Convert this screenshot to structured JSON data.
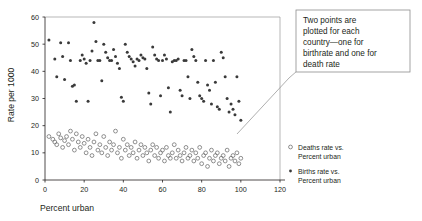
{
  "chart_data": {
    "type": "scatter",
    "title": "",
    "xlabel": "Percent urban",
    "ylabel": "Rate per 1000",
    "xlim": [
      0,
      120
    ],
    "ylim": [
      0,
      60
    ],
    "xticks": [
      0,
      20,
      40,
      60,
      80,
      100,
      120
    ],
    "yticks": [
      0,
      10,
      20,
      30,
      40,
      50,
      60
    ],
    "grid": false,
    "legend_position": "right",
    "annotation": "Two points are plotted for each country—one for birthrate and one for death rate",
    "series": [
      {
        "name": "Births rate vs. Percent urban",
        "marker": "filled-circle",
        "color": "#3a3a3a",
        "points": [
          [
            2,
            51.5
          ],
          [
            5,
            44.5
          ],
          [
            6,
            38
          ],
          [
            8,
            50.5
          ],
          [
            9,
            45.5
          ],
          [
            10,
            37
          ],
          [
            12,
            50.5
          ],
          [
            13,
            44
          ],
          [
            14,
            34.5
          ],
          [
            15,
            35
          ],
          [
            16,
            29
          ],
          [
            18,
            44
          ],
          [
            19,
            46
          ],
          [
            20,
            44.5
          ],
          [
            21,
            43
          ],
          [
            22,
            29
          ],
          [
            23,
            44
          ],
          [
            24,
            47.5
          ],
          [
            25,
            58
          ],
          [
            26,
            51
          ],
          [
            27,
            44
          ],
          [
            28,
            44
          ],
          [
            29,
            36.5
          ],
          [
            30,
            50
          ],
          [
            31,
            47
          ],
          [
            32,
            45
          ],
          [
            33,
            44
          ],
          [
            34,
            44
          ],
          [
            35,
            48
          ],
          [
            36,
            45.5
          ],
          [
            37,
            43
          ],
          [
            38,
            41
          ],
          [
            39,
            30.5
          ],
          [
            40,
            29
          ],
          [
            41,
            50
          ],
          [
            42,
            47
          ],
          [
            43,
            45.5
          ],
          [
            44,
            44.5
          ],
          [
            45,
            43.5
          ],
          [
            46,
            42
          ],
          [
            47,
            44.5
          ],
          [
            48,
            44
          ],
          [
            49,
            46
          ],
          [
            50,
            45
          ],
          [
            51,
            44.5
          ],
          [
            52,
            41
          ],
          [
            53,
            32
          ],
          [
            54,
            28
          ],
          [
            55,
            49
          ],
          [
            56,
            46
          ],
          [
            57,
            44.5
          ],
          [
            58,
            44
          ],
          [
            59,
            31
          ],
          [
            60,
            44
          ],
          [
            61,
            46
          ],
          [
            62,
            44.5
          ],
          [
            63,
            34
          ],
          [
            64,
            25
          ],
          [
            65,
            43.5
          ],
          [
            66,
            44
          ],
          [
            67,
            44
          ],
          [
            68,
            44.5
          ],
          [
            69,
            33
          ],
          [
            70,
            31
          ],
          [
            71,
            44
          ],
          [
            72,
            44
          ],
          [
            73,
            38
          ],
          [
            74,
            30
          ],
          [
            75,
            48
          ],
          [
            76,
            45.5
          ],
          [
            77,
            44
          ],
          [
            78,
            36
          ],
          [
            79,
            31
          ],
          [
            80,
            30
          ],
          [
            81,
            29
          ],
          [
            82,
            44
          ],
          [
            83,
            35
          ],
          [
            84,
            33
          ],
          [
            85,
            28
          ],
          [
            86,
            44
          ],
          [
            87,
            36
          ],
          [
            88,
            27
          ],
          [
            89,
            26
          ],
          [
            90,
            47
          ],
          [
            91,
            45
          ],
          [
            92,
            38
          ],
          [
            93,
            30
          ],
          [
            94,
            25
          ],
          [
            95,
            28
          ],
          [
            96,
            26
          ],
          [
            97,
            24
          ],
          [
            98,
            38
          ],
          [
            99,
            29
          ],
          [
            100,
            22
          ]
        ]
      },
      {
        "name": "Deaths rate vs. Percent urban",
        "marker": "open-circle",
        "color": "#6b6b6b",
        "points": [
          [
            2,
            16
          ],
          [
            4,
            15
          ],
          [
            5,
            14
          ],
          [
            6,
            13
          ],
          [
            7,
            17
          ],
          [
            8,
            15.5
          ],
          [
            9,
            12
          ],
          [
            10,
            14.5
          ],
          [
            11,
            16
          ],
          [
            12,
            13
          ],
          [
            13,
            18
          ],
          [
            14,
            15
          ],
          [
            15,
            11
          ],
          [
            16,
            17
          ],
          [
            17,
            14
          ],
          [
            18,
            12
          ],
          [
            19,
            16
          ],
          [
            20,
            13.5
          ],
          [
            21,
            10
          ],
          [
            22,
            15
          ],
          [
            23,
            12
          ],
          [
            24,
            9
          ],
          [
            25,
            14
          ],
          [
            26,
            17
          ],
          [
            27,
            11
          ],
          [
            28,
            13
          ],
          [
            29,
            10
          ],
          [
            30,
            16
          ],
          [
            31,
            12
          ],
          [
            32,
            9
          ],
          [
            33,
            14
          ],
          [
            34,
            11
          ],
          [
            35,
            13
          ],
          [
            36,
            18
          ],
          [
            37,
            10
          ],
          [
            38,
            12
          ],
          [
            39,
            8
          ],
          [
            40,
            15
          ],
          [
            41,
            11
          ],
          [
            42,
            13
          ],
          [
            43,
            9
          ],
          [
            44,
            12
          ],
          [
            45,
            10
          ],
          [
            46,
            14
          ],
          [
            47,
            8
          ],
          [
            48,
            11
          ],
          [
            49,
            13
          ],
          [
            50,
            9
          ],
          [
            51,
            12
          ],
          [
            52,
            10
          ],
          [
            53,
            7
          ],
          [
            54,
            11
          ],
          [
            55,
            13
          ],
          [
            56,
            9
          ],
          [
            57,
            12
          ],
          [
            58,
            8
          ],
          [
            59,
            10
          ],
          [
            60,
            11
          ],
          [
            61,
            7
          ],
          [
            62,
            12
          ],
          [
            63,
            9
          ],
          [
            64,
            8
          ],
          [
            65,
            10
          ],
          [
            66,
            13
          ],
          [
            67,
            8
          ],
          [
            68,
            11
          ],
          [
            69,
            9
          ],
          [
            70,
            7
          ],
          [
            71,
            10
          ],
          [
            72,
            12
          ],
          [
            73,
            8
          ],
          [
            74,
            9
          ],
          [
            75,
            11
          ],
          [
            76,
            7
          ],
          [
            77,
            10
          ],
          [
            78,
            8
          ],
          [
            79,
            12
          ],
          [
            80,
            6
          ],
          [
            81,
            9
          ],
          [
            82,
            10
          ],
          [
            83,
            5
          ],
          [
            84,
            8
          ],
          [
            85,
            11
          ],
          [
            86,
            7
          ],
          [
            87,
            9
          ],
          [
            88,
            10
          ],
          [
            89,
            6
          ],
          [
            90,
            8
          ],
          [
            91,
            9
          ],
          [
            92,
            7
          ],
          [
            93,
            11
          ],
          [
            94,
            5
          ],
          [
            95,
            8
          ],
          [
            96,
            9
          ],
          [
            97,
            7
          ],
          [
            98,
            10
          ],
          [
            99,
            6
          ],
          [
            100,
            8
          ]
        ]
      }
    ]
  },
  "legend": {
    "items": [
      {
        "marker": "open-circle",
        "line1": "Deaths rate vs.",
        "line2": "Percent urban"
      },
      {
        "marker": "filled-circle",
        "line1": "Births rate vs.",
        "line2": "Percent urban"
      }
    ]
  },
  "callout": {
    "lines": [
      "Two points are",
      "plotted for each",
      "country—one for",
      "birthrate and one for",
      "death rate"
    ]
  }
}
